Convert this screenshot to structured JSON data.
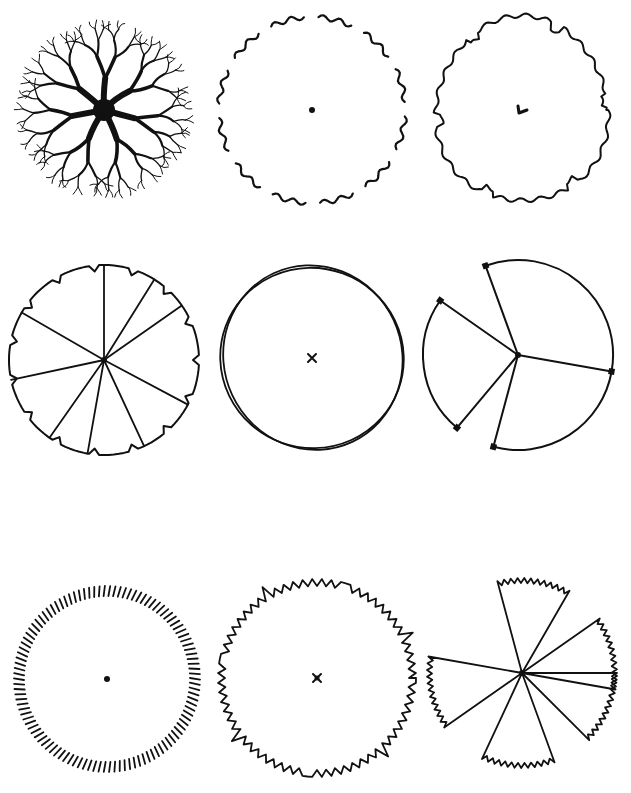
{
  "page": {
    "width": 631,
    "height": 793,
    "background": "#ffffff",
    "ink": "#111111"
  },
  "figure": {
    "rows": 3,
    "columns": 3
  },
  "symbols": [
    {
      "id": "branching-tree",
      "style": "branching",
      "cx": 104,
      "cy": 110,
      "r": 94,
      "center_mark": "trunk-blob",
      "arms": 7
    },
    {
      "id": "wavy-broken-outline",
      "style": "wavy-dashed",
      "cx": 312,
      "cy": 110,
      "r": 93,
      "center_mark": "dot",
      "segments": 12
    },
    {
      "id": "wavy-continuous-outline",
      "style": "wavy-solid",
      "cx": 522,
      "cy": 110,
      "r": 88,
      "center_mark": "check",
      "notches": 6
    },
    {
      "id": "notched-wedges",
      "style": "notched-radial",
      "cx": 104,
      "cy": 360,
      "r": 95,
      "center_mark": "dot",
      "spokes": [
        0,
        32,
        55,
        118,
        155,
        190,
        215,
        258,
        300
      ]
    },
    {
      "id": "double-line-circle",
      "style": "double-circle",
      "cx": 312,
      "cy": 358,
      "r": 92,
      "center_mark": "x"
    },
    {
      "id": "open-sector-circle",
      "style": "open-sector",
      "cx": 518,
      "cy": 355,
      "r": 95,
      "center_mark": "dot",
      "spokes": [
        -55,
        -20,
        100,
        195,
        220
      ]
    },
    {
      "id": "radial-tick-ring",
      "style": "tick-ring",
      "cx": 107,
      "cy": 679,
      "r": 93,
      "center_mark": "dot",
      "ticks": 110,
      "tick_len": 10
    },
    {
      "id": "zigzag-outline",
      "style": "zigzag",
      "cx": 317,
      "cy": 678,
      "r": 95,
      "center_mark": "x-dot",
      "teeth": 64
    },
    {
      "id": "zigzag-pinwheel",
      "style": "zigzag-pinwheel",
      "cx": 522,
      "cy": 673,
      "r": 95,
      "center_mark": "dot",
      "blades": 5
    }
  ],
  "caption": {
    "text": "",
    "note": "illegible cropped caption at bottom edge"
  }
}
